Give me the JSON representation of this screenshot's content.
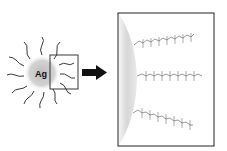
{
  "diagram": {
    "particle_label": "Ag",
    "arrow": "right-arrow",
    "zoom_box": "inset-region",
    "panel": "magnified-surface-view",
    "chain_count": 3,
    "chain_atoms": [
      "F",
      "F",
      "F",
      "F",
      "F",
      "F",
      "F",
      "F",
      "F",
      "F",
      "F",
      "F",
      "F",
      "F",
      "F",
      "F"
    ],
    "colors": {
      "line": "#222222",
      "particle_fill": "#c9c9c9",
      "surface": "#d0d0d0",
      "background": "#ffffff"
    }
  }
}
